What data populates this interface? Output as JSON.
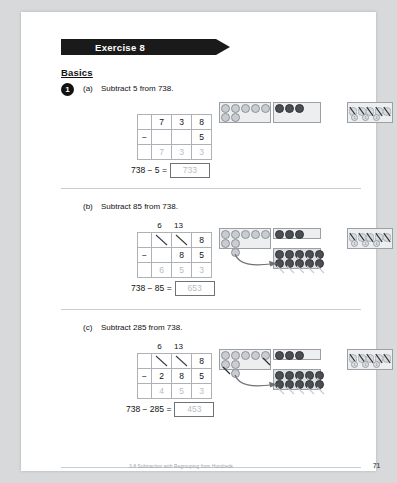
{
  "banner": {
    "label": "Exercise 8"
  },
  "section": {
    "title": "Basics"
  },
  "question": {
    "number": "1",
    "parts": [
      {
        "letter": "(a)",
        "prompt": "Subtract 5 from 738.",
        "regroup": {
          "hundreds": "",
          "tens": ""
        },
        "minuend": {
          "hundreds": "7",
          "tens": "3",
          "ones": "8"
        },
        "minuend_struck": {
          "hundreds": false,
          "tens": false,
          "ones": false
        },
        "operator": "−",
        "subtrahend": {
          "hundreds": "",
          "tens": "",
          "ones": "5"
        },
        "answer_row": {
          "hundreds": "7",
          "tens": "3",
          "ones": "3"
        },
        "equation": "738 − 5 =",
        "answer": "733",
        "chart": {
          "hundreds_discs": 7,
          "hundreds_crossed": 0,
          "tens_discs": 3,
          "tens_crossed": 0,
          "ones_tallies": 5,
          "ones_minidiscs": [
            "1",
            "1",
            "1"
          ],
          "regrouping_arrow": false
        }
      },
      {
        "letter": "(b)",
        "prompt": "Subtract 85 from 738.",
        "regroup": {
          "hundreds": "6",
          "tens": "13"
        },
        "minuend": {
          "hundreds": "7",
          "tens": "3",
          "ones": "8"
        },
        "minuend_struck": {
          "hundreds": true,
          "tens": true,
          "ones": false
        },
        "operator": "−",
        "subtrahend": {
          "hundreds": "",
          "tens": "8",
          "ones": "5"
        },
        "answer_row": {
          "hundreds": "6",
          "tens": "5",
          "ones": "3"
        },
        "equation": "738 − 85 =",
        "answer": "653",
        "chart": {
          "hundreds_discs": 7,
          "hundreds_crossed": 0,
          "tens_discs": 3,
          "tens_regrouped": 10,
          "tens_crossed": 8,
          "ones_tallies": 5,
          "ones_minidiscs": [
            "1",
            "1",
            "1"
          ],
          "regrouping_arrow": true
        }
      },
      {
        "letter": "(c)",
        "prompt": "Subtract 285 from 738.",
        "regroup": {
          "hundreds": "6",
          "tens": "13"
        },
        "minuend": {
          "hundreds": "7",
          "tens": "3",
          "ones": "8"
        },
        "minuend_struck": {
          "hundreds": true,
          "tens": true,
          "ones": false
        },
        "operator": "−",
        "subtrahend": {
          "hundreds": "2",
          "tens": "8",
          "ones": "5"
        },
        "answer_row": {
          "hundreds": "4",
          "tens": "5",
          "ones": "3"
        },
        "equation": "738 − 285 =",
        "answer": "453",
        "chart": {
          "hundreds_discs": 7,
          "hundreds_crossed": 2,
          "tens_discs": 3,
          "tens_regrouped": 10,
          "tens_crossed": 8,
          "ones_tallies": 5,
          "ones_minidiscs": [
            "1",
            "1",
            "1"
          ],
          "regrouping_arrow": true
        }
      }
    ]
  },
  "footer": {
    "text": "3-8 Subtraction with Regrouping from Hundreds",
    "page": "71"
  },
  "colors": {
    "banner": "#1a1a1a",
    "answer_text": "#b9bdc1",
    "rule": "#c9ccd0",
    "tens_disc": "#4b4f54",
    "hundreds_disc": "#c9ccd0"
  }
}
